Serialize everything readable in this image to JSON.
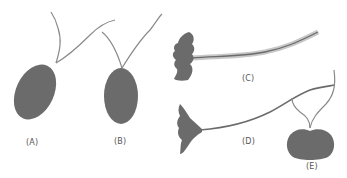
{
  "diagram": {
    "type": "flagellar-arrangement-illustration",
    "colors": {
      "body": "#6b6b6b",
      "flagellum": "#8a8a8a",
      "background": "#ffffff",
      "label": "#555555"
    },
    "cells": [
      {
        "id": "A",
        "label": "(A)",
        "shape": "oval-tilted",
        "flagella": 2
      },
      {
        "id": "B",
        "label": "(B)",
        "shape": "oval-upright",
        "flagella": 2
      },
      {
        "id": "C",
        "label": "(C)",
        "shape": "irregular-lobed",
        "flagella": 1,
        "style": "hairy"
      },
      {
        "id": "D",
        "label": "(D)",
        "shape": "fan-tapered",
        "flagella": 1
      },
      {
        "id": "E",
        "label": "(E)",
        "shape": "kidney-bean",
        "flagella": 2
      }
    ]
  }
}
